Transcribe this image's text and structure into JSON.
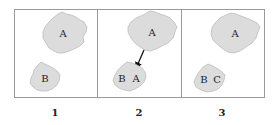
{
  "figure": {
    "panels": [
      {
        "number": "1",
        "blobs": [
          {
            "id": "large",
            "labels": [
              "A"
            ]
          },
          {
            "id": "small",
            "labels": [
              "B"
            ]
          }
        ],
        "arrow": false
      },
      {
        "number": "2",
        "blobs": [
          {
            "id": "large",
            "labels": [
              "A"
            ]
          },
          {
            "id": "small",
            "labels": [
              "B",
              "A"
            ]
          }
        ],
        "arrow": true,
        "arrow_from": "large",
        "arrow_to": "small"
      },
      {
        "number": "3",
        "blobs": [
          {
            "id": "large",
            "labels": [
              "A"
            ]
          },
          {
            "id": "small",
            "labels": [
              "B",
              "C"
            ]
          }
        ],
        "arrow": false
      }
    ],
    "colors": {
      "blob_fill": "#dcdcdc",
      "border": "#9a9a9a",
      "text": "#222222"
    }
  }
}
